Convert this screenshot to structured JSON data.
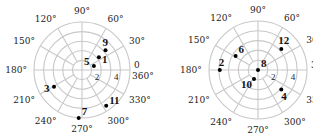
{
  "chart_data": [
    {
      "type": "scatter",
      "subtype": "polar",
      "title": "",
      "center_px": [
        82,
        70
      ],
      "outer_radius_px": 48,
      "rings": 5,
      "r_max": 5,
      "angle_spokes_deg": [
        0,
        30,
        60,
        90,
        120,
        150,
        180,
        210,
        240,
        270,
        300,
        330
      ],
      "angle_labels": [
        {
          "deg": 0,
          "text": "0",
          "text2": "360°"
        },
        {
          "deg": 30,
          "text": "30°"
        },
        {
          "deg": 60,
          "text": "60°"
        },
        {
          "deg": 90,
          "text": "90°"
        },
        {
          "deg": 120,
          "text": "120°"
        },
        {
          "deg": 150,
          "text": "150°"
        },
        {
          "deg": 180,
          "text": "180°"
        },
        {
          "deg": 210,
          "text": "210°"
        },
        {
          "deg": 240,
          "text": "240°"
        },
        {
          "deg": 270,
          "text": "270°"
        },
        {
          "deg": 300,
          "text": "300°"
        },
        {
          "deg": 330,
          "text": "330°"
        }
      ],
      "radius_tick_labels": [
        {
          "r": 2,
          "text": "2"
        },
        {
          "r": 4,
          "text": "4"
        }
      ],
      "points": [
        {
          "label": "1",
          "r": 2.2,
          "theta_deg": 37,
          "label_dx": 3,
          "label_dy": 6
        },
        {
          "label": "3",
          "r": 3.4,
          "theta_deg": 211,
          "label_dx": -10,
          "label_dy": 5
        },
        {
          "label": "5",
          "r": 1.3,
          "theta_deg": 18,
          "label_dx": -10,
          "label_dy": -1
        },
        {
          "label": "7",
          "r": 5.0,
          "theta_deg": 266,
          "label_dx": 3,
          "label_dy": -3
        },
        {
          "label": "9",
          "r": 3.2,
          "theta_deg": 40,
          "label_dx": -3,
          "label_dy": -4
        },
        {
          "label": "11",
          "r": 4.5,
          "theta_deg": 304,
          "label_dx": 3,
          "label_dy": -2
        }
      ]
    },
    {
      "type": "scatter",
      "subtype": "polar",
      "title": "",
      "center_px": [
        258,
        70
      ],
      "outer_radius_px": 49,
      "rings": 5,
      "r_max": 5,
      "angle_spokes_deg": [
        0,
        30,
        60,
        90,
        120,
        150,
        180,
        210,
        240,
        270,
        300,
        330
      ],
      "angle_labels": [
        {
          "deg": 0,
          "text": "3"
        },
        {
          "deg": 30,
          "text": "30°"
        },
        {
          "deg": 60,
          "text": "60°"
        },
        {
          "deg": 90,
          "text": "90°"
        },
        {
          "deg": 120,
          "text": "120°"
        },
        {
          "deg": 150,
          "text": "150°"
        },
        {
          "deg": 180,
          "text": "180°"
        },
        {
          "deg": 210,
          "text": "210°"
        },
        {
          "deg": 240,
          "text": "240°"
        },
        {
          "deg": 270,
          "text": "270°"
        },
        {
          "deg": 300,
          "text": "300°"
        },
        {
          "deg": 330,
          "text": "33"
        }
      ],
      "radius_tick_labels": [
        {
          "r": 2,
          "text": "2"
        },
        {
          "r": 4,
          "text": "4"
        }
      ],
      "points": [
        {
          "label": "2",
          "r": 3.9,
          "theta_deg": 180,
          "label_dx": -1,
          "label_dy": -4
        },
        {
          "label": "4",
          "r": 3.1,
          "theta_deg": 320,
          "label_dx": 0,
          "label_dy": 10
        },
        {
          "label": "6",
          "r": 2.7,
          "theta_deg": 148,
          "label_dx": 3,
          "label_dy": -3
        },
        {
          "label": "8",
          "r": 0.0,
          "theta_deg": 0,
          "label_dx": 3,
          "label_dy": -3
        },
        {
          "label": "10",
          "r": 1.0,
          "theta_deg": 246,
          "label_dx": -13,
          "label_dy": 9
        },
        {
          "label": "12",
          "r": 3.2,
          "theta_deg": 42,
          "label_dx": -3,
          "label_dy": -5
        }
      ]
    }
  ]
}
